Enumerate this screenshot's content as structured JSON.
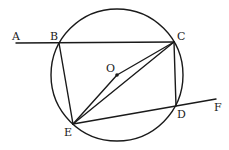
{
  "diagram": {
    "type": "geometry",
    "labels": {
      "A": "A",
      "B": "B",
      "C": "C",
      "O": "O",
      "D": "D",
      "E": "E",
      "F": "F"
    },
    "segments": [
      [
        "A",
        "C"
      ],
      [
        "B",
        "E"
      ],
      [
        "C",
        "D"
      ],
      [
        "C",
        "E"
      ],
      [
        "O",
        "E"
      ],
      [
        "O",
        "C"
      ],
      [
        "E",
        "F"
      ]
    ],
    "circle": {
      "center": "O",
      "points_on_circle": [
        "B",
        "C",
        "D",
        "E"
      ]
    },
    "colors": {
      "stroke": "#1a1a1a",
      "background": "#ffffff"
    }
  }
}
